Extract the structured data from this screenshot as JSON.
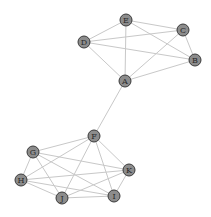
{
  "graph": {
    "nodes": [
      {
        "id": "A",
        "x": 125,
        "y": 81
      },
      {
        "id": "B",
        "x": 195,
        "y": 60
      },
      {
        "id": "C",
        "x": 183,
        "y": 30
      },
      {
        "id": "D",
        "x": 84,
        "y": 42
      },
      {
        "id": "E",
        "x": 126,
        "y": 20
      },
      {
        "id": "F",
        "x": 94,
        "y": 136
      },
      {
        "id": "G",
        "x": 33,
        "y": 152
      },
      {
        "id": "H",
        "x": 21,
        "y": 180
      },
      {
        "id": "I",
        "x": 114,
        "y": 196
      },
      {
        "id": "J",
        "x": 62,
        "y": 198
      },
      {
        "id": "K",
        "x": 129,
        "y": 170
      }
    ],
    "edges": [
      [
        "E",
        "C"
      ],
      [
        "E",
        "B"
      ],
      [
        "E",
        "A"
      ],
      [
        "E",
        "D"
      ],
      [
        "D",
        "C"
      ],
      [
        "D",
        "B"
      ],
      [
        "D",
        "A"
      ],
      [
        "C",
        "A"
      ],
      [
        "C",
        "B"
      ],
      [
        "A",
        "B"
      ],
      [
        "A",
        "F"
      ],
      [
        "F",
        "G"
      ],
      [
        "F",
        "H"
      ],
      [
        "F",
        "J"
      ],
      [
        "F",
        "I"
      ],
      [
        "F",
        "K"
      ],
      [
        "G",
        "H"
      ],
      [
        "G",
        "J"
      ],
      [
        "G",
        "I"
      ],
      [
        "G",
        "K"
      ],
      [
        "H",
        "K"
      ],
      [
        "H",
        "J"
      ],
      [
        "H",
        "I"
      ],
      [
        "J",
        "K"
      ],
      [
        "J",
        "I"
      ],
      [
        "I",
        "K"
      ]
    ],
    "node_radius": 6,
    "colors": {
      "node_fill": "#8c8c8c",
      "node_stroke": "#3a3a3a",
      "edge": "#c8c8c8",
      "label": "#2a2a2a"
    }
  }
}
